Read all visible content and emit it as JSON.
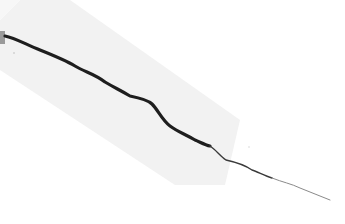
{
  "image": {
    "description": "Grayscale photo of a thin dark crack running diagonally from upper-left to lower-right on a pale surface, with a faint lighter rectangular band along the crack",
    "colors": {
      "background": "#ffffff",
      "band": "#f1f1f1",
      "crack_dark": "#1a1a1a",
      "crack_light": "#8a8a8a",
      "edge_mark": "#9a9a9a"
    }
  }
}
